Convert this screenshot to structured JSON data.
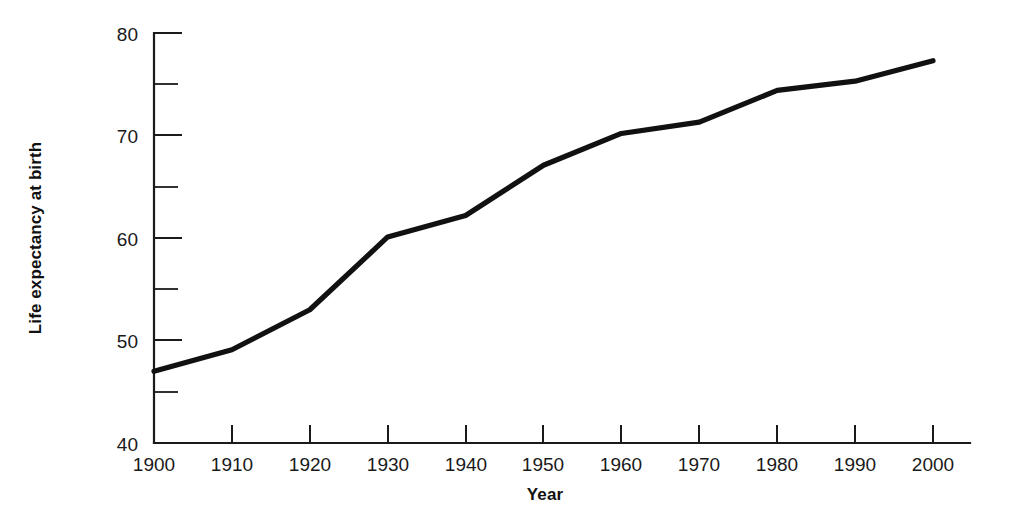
{
  "chart_data": {
    "type": "line",
    "title": "",
    "subtitle": "",
    "xlabel": "Year",
    "ylabel": "Life expectancy at birth",
    "x": [
      1900,
      1910,
      1920,
      1930,
      1940,
      1950,
      1960,
      1970,
      1980,
      1990,
      2000
    ],
    "values": [
      47.0,
      49.1,
      53.0,
      60.1,
      62.2,
      67.1,
      70.2,
      71.3,
      74.4,
      75.3,
      77.3
    ],
    "series": [
      {
        "name": "Life expectancy at birth",
        "values": [
          47.0,
          49.1,
          53.0,
          60.1,
          62.2,
          67.1,
          70.2,
          71.3,
          74.4,
          75.3,
          77.3
        ],
        "color": "#111111"
      }
    ],
    "xlim": [
      1900,
      2000
    ],
    "ylim": [
      40,
      80
    ],
    "x_tick_labels": [
      "1900",
      "1910",
      "1920",
      "1930",
      "1940",
      "1950",
      "1960",
      "1970",
      "1980",
      "1990",
      "2000"
    ],
    "y_tick_labels": [
      "40",
      "50",
      "60",
      "70",
      "80"
    ],
    "y_ticks_major": [
      40,
      50,
      60,
      70,
      80
    ],
    "y_ticks_minor": [
      45,
      55,
      65,
      75
    ],
    "grid": false,
    "legend": false,
    "legend_position": "none",
    "annotations": []
  },
  "axes": {
    "y_title": "Life expectancy at birth",
    "x_title": "Year"
  },
  "colors": {
    "line": "#111111",
    "axis": "#1a1a1a",
    "background": "#ffffff",
    "text": "#1a1a1a"
  }
}
